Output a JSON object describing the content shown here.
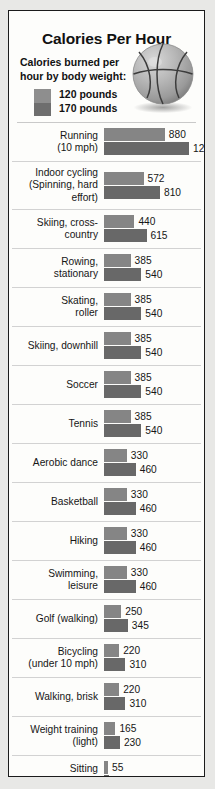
{
  "poster": {
    "title": "Calories Per Hour",
    "subtitle": "Calories burned per hour by body weight:",
    "legend": {
      "light_label": "120 pounds",
      "dark_label": "170 pounds",
      "light_color": "#8e8e8e",
      "dark_color": "#6e6e6e"
    },
    "illustration": "basketball-icon"
  },
  "chart_data": {
    "type": "bar",
    "title": "Calories Per Hour",
    "subtitle": "Calories burned per hour by body weight:",
    "xlabel": "",
    "ylabel": "",
    "orientation": "horizontal",
    "grid": false,
    "legend_position": "top-left",
    "xlim": [
      0,
      1230
    ],
    "categories": [
      "Running (10 mph)",
      "Indoor cycling (Spinning, hard effort)",
      "Skiing, cross-country",
      "Rowing, stationary",
      "Skating, roller",
      "Skiing, downhill",
      "Soccer",
      "Tennis",
      "Aerobic dance",
      "Basketball",
      "Hiking",
      "Swimming, leisure",
      "Golf (walking)",
      "Bicycling (under 10 mph)",
      "Walking, brisk",
      "Weight training (light)",
      "Sitting (Watching TV)"
    ],
    "series": [
      {
        "name": "120 pounds",
        "color": "#858585",
        "values": [
          880,
          572,
          440,
          385,
          385,
          385,
          385,
          385,
          330,
          330,
          330,
          330,
          250,
          220,
          220,
          165,
          55
        ]
      },
      {
        "name": "170 pounds",
        "color": "#686868",
        "values": [
          1230,
          810,
          615,
          540,
          540,
          540,
          540,
          540,
          460,
          460,
          460,
          460,
          345,
          310,
          310,
          230,
          75
        ]
      }
    ]
  },
  "rows": [
    {
      "label_lines": [
        "Running",
        "(10 mph)"
      ],
      "light": 880,
      "dark": 1230
    },
    {
      "label_lines": [
        "Indoor cycling",
        "(Spinning, hard",
        "effort)"
      ],
      "light": 572,
      "dark": 810
    },
    {
      "label_lines": [
        "Skiing, cross-",
        "country"
      ],
      "light": 440,
      "dark": 615
    },
    {
      "label_lines": [
        "Rowing,",
        "stationary"
      ],
      "light": 385,
      "dark": 540
    },
    {
      "label_lines": [
        "Skating,",
        "roller"
      ],
      "light": 385,
      "dark": 540
    },
    {
      "label_lines": [
        "Skiing, downhill"
      ],
      "light": 385,
      "dark": 540
    },
    {
      "label_lines": [
        "Soccer"
      ],
      "light": 385,
      "dark": 540
    },
    {
      "label_lines": [
        "Tennis"
      ],
      "light": 385,
      "dark": 540
    },
    {
      "label_lines": [
        "Aerobic dance"
      ],
      "light": 330,
      "dark": 460
    },
    {
      "label_lines": [
        "Basketball"
      ],
      "light": 330,
      "dark": 460
    },
    {
      "label_lines": [
        "Hiking"
      ],
      "light": 330,
      "dark": 460
    },
    {
      "label_lines": [
        "Swimming,",
        "leisure"
      ],
      "light": 330,
      "dark": 460
    },
    {
      "label_lines": [
        "Golf (walking)"
      ],
      "light": 250,
      "dark": 345
    },
    {
      "label_lines": [
        "Bicycling",
        "(under 10 mph)"
      ],
      "light": 220,
      "dark": 310
    },
    {
      "label_lines": [
        "Walking, brisk"
      ],
      "light": 220,
      "dark": 310
    },
    {
      "label_lines": [
        "Weight training",
        "(light)"
      ],
      "light": 165,
      "dark": 230
    },
    {
      "label_lines": [
        "Sitting",
        "(Watching TV)"
      ],
      "light": 55,
      "dark": 75
    }
  ]
}
